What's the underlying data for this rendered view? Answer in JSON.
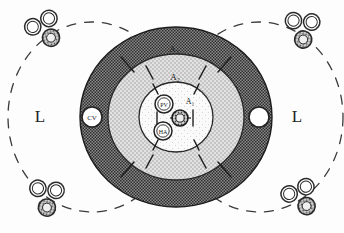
{
  "figure": {
    "width": 344,
    "height": 233,
    "background": "#fdfdfd",
    "ink": "#222222"
  },
  "zones": {
    "zone3": {
      "label": "A₃",
      "name": "acinar-zone-3",
      "fill": "#6e6e6e",
      "texture": "dark-checker",
      "rx": 96,
      "ry": 90
    },
    "zone2": {
      "label": "A₂",
      "name": "acinar-zone-2",
      "fill": "#d8d8d8",
      "texture": "light-stipple",
      "rx": 68,
      "ry": 63
    },
    "zone1": {
      "label": "A₁",
      "name": "acinar-zone-1",
      "fill": "#f7f7f7",
      "texture": "faint-dots",
      "rx": 37,
      "ry": 35
    }
  },
  "zone_labels": [
    {
      "text": "A₃",
      "x": 174,
      "y": 52,
      "size": 9
    },
    {
      "text": "A₂",
      "x": 175,
      "y": 80,
      "size": 9
    },
    {
      "text": "A₁",
      "x": 190,
      "y": 104,
      "size": 8
    }
  ],
  "central_veins": [
    {
      "label": "CV",
      "name": "central-vein-left",
      "cx": 92,
      "cy": 117,
      "r": 10,
      "show_label": true
    },
    {
      "label": "",
      "name": "central-vein-right",
      "cx": 259,
      "cy": 117,
      "r": 10,
      "show_label": false
    }
  ],
  "portal_triad_center": {
    "name": "portal-triad-center",
    "portal_vein": {
      "label": "PV",
      "cx": 164,
      "cy": 104,
      "r": 9
    },
    "hepatic_artery": {
      "label": "HA",
      "cx": 163,
      "cy": 131,
      "r": 9
    },
    "bile_duct": {
      "label": "",
      "cx": 180,
      "cy": 118,
      "r": 8
    }
  },
  "corner_triads": [
    {
      "name": "portal-triad-top-left",
      "cx": 46,
      "cy": 32,
      "rot": -18
    },
    {
      "name": "portal-triad-top-right",
      "cx": 302,
      "cy": 32,
      "rot": 14
    },
    {
      "name": "portal-triad-bottom-left",
      "cx": 46,
      "cy": 200,
      "rot": 16
    },
    {
      "name": "portal-triad-bottom-right",
      "cx": 302,
      "cy": 200,
      "rot": -14
    }
  ],
  "lobules": [
    {
      "label": "L",
      "name": "lobule-left",
      "text_x": 40,
      "text_y": 122,
      "cx": 92,
      "cy": 117,
      "rx": 84,
      "ry": 95
    },
    {
      "label": "L",
      "name": "lobule-right",
      "text_x": 297,
      "text_y": 122,
      "cx": 259,
      "cy": 117,
      "rx": 84,
      "ry": 95
    }
  ],
  "legend_semantics": {
    "PV": "portal vein",
    "HA": "hepatic artery",
    "CV": "central vein",
    "L": "lobule",
    "A1": "acinar zone 1",
    "A2": "acinar zone 2",
    "A3": "acinar zone 3"
  }
}
